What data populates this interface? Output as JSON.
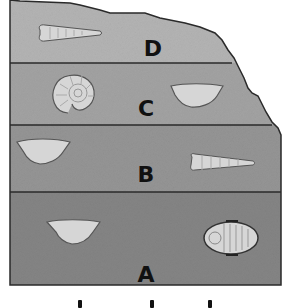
{
  "diagram": {
    "colors": {
      "layer_D": "#b4b4b4",
      "layer_C": "#a3a3a3",
      "layer_B": "#959595",
      "layer_A": "#858585",
      "outline": "#2a2a2a",
      "fossil_fill": "#d6d6d6"
    },
    "layers": [
      {
        "id": "D",
        "label": "D",
        "fossils": [
          "horn-coral",
          ""
        ]
      },
      {
        "id": "C",
        "label": "C",
        "fossils": [
          "ammonite",
          "brachiopod"
        ]
      },
      {
        "id": "B",
        "label": "B",
        "fossils": [
          "brachiopod",
          "horn-coral"
        ]
      },
      {
        "id": "A",
        "label": "A",
        "fossils": [
          "brachiopod",
          "trilobite"
        ]
      }
    ]
  }
}
